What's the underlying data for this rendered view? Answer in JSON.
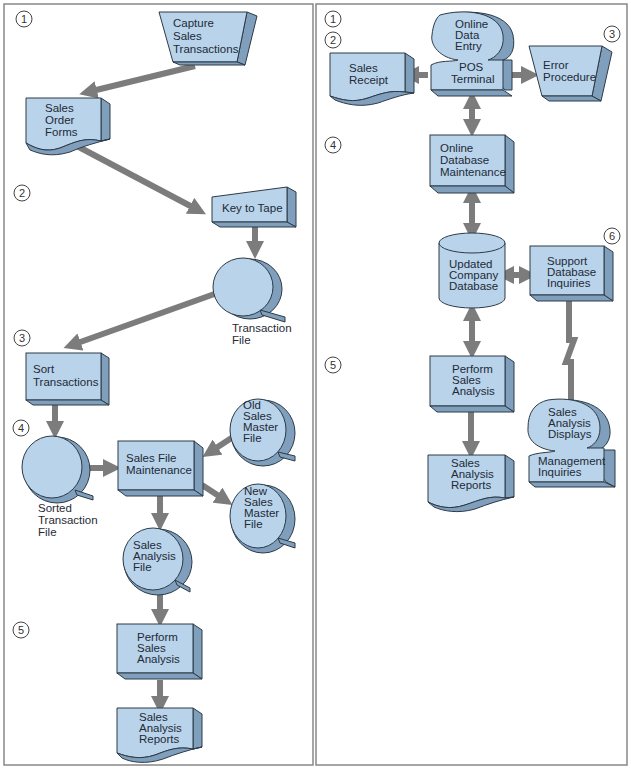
{
  "diagram": {
    "colors": {
      "shape_fill": "#b8d3ea",
      "shape_side": "#7f9fbd",
      "outline": "#2d3a46",
      "arrow": "#7c7c7c",
      "frame": "#888888"
    },
    "left_panel": {
      "steps": [
        "1",
        "2",
        "3",
        "4",
        "5"
      ],
      "nodes": {
        "capture": [
          "Capture",
          "Sales",
          "Transactions"
        ],
        "order_forms": [
          "Sales",
          "Order",
          "Forms"
        ],
        "key_to_tape": [
          "Key to Tape"
        ],
        "transaction_file_label": [
          "Transaction",
          "File"
        ],
        "sort": [
          "Sort",
          "Transactions"
        ],
        "sorted_file_label": [
          "Sorted",
          "Transaction",
          "File"
        ],
        "old_master": [
          "Old",
          "Sales",
          "Master",
          "File"
        ],
        "maintenance": [
          "Sales File",
          "Maintenance"
        ],
        "new_master": [
          "New",
          "Sales",
          "Master",
          "File"
        ],
        "analysis_file": [
          "Sales",
          "Analysis",
          "File"
        ],
        "perform": [
          "Perform",
          "Sales",
          "Analysis"
        ],
        "reports": [
          "Sales",
          "Analysis",
          "Reports"
        ]
      }
    },
    "right_panel": {
      "steps": [
        "1",
        "2",
        "3",
        "4",
        "5",
        "6"
      ],
      "nodes": {
        "online_entry": [
          "Online",
          "Data",
          "Entry"
        ],
        "pos": [
          "POS",
          "Terminal"
        ],
        "receipt": [
          "Sales",
          "Receipt"
        ],
        "error": [
          "Error",
          "Procedure"
        ],
        "db_maint": [
          "Online",
          "Database",
          "Maintenance"
        ],
        "db": [
          "Updated",
          "Company",
          "Database"
        ],
        "support": [
          "Support",
          "Database",
          "Inquiries"
        ],
        "perform": [
          "Perform",
          "Sales",
          "Analysis"
        ],
        "reports": [
          "Sales",
          "Analysis",
          "Reports"
        ],
        "displays": [
          "Sales",
          "Analysis",
          "Displays"
        ],
        "mgmt": [
          "Management",
          "Inquiries"
        ]
      }
    }
  }
}
